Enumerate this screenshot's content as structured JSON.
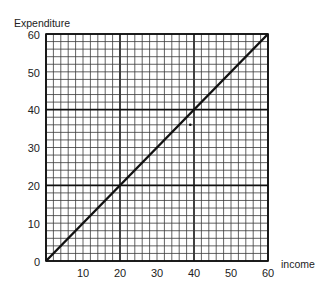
{
  "chart_data": {
    "type": "line",
    "title": "",
    "xlabel": "income",
    "ylabel": "Expenditure",
    "xlim": [
      0,
      60
    ],
    "ylim": [
      0,
      60
    ],
    "x_ticks": [
      10,
      20,
      30,
      40,
      50,
      60
    ],
    "y_ticks": [
      0,
      10,
      20,
      30,
      40,
      50,
      60
    ],
    "grid": {
      "on": true,
      "minor_step": 2,
      "major_step": 20
    },
    "series": [
      {
        "name": "45-degree line (expenditure = income)",
        "x": [
          0,
          60
        ],
        "y": [
          0,
          60
        ]
      }
    ],
    "annotations": [
      {
        "type": "dot",
        "x": 39,
        "y": 36
      }
    ],
    "legend": null
  },
  "labels": {
    "y_title": "Expenditure",
    "x_title": "income",
    "y0": "0",
    "y10": "10",
    "y20": "20",
    "y30": "30",
    "y40": "40",
    "y50": "50",
    "y60": "60",
    "x10": "10",
    "x20": "20",
    "x30": "30",
    "x40": "40",
    "x50": "50",
    "x60": "60"
  },
  "colors": {
    "ink": "#111111",
    "minor_grid": "#3a3a3a",
    "background": "#ffffff"
  }
}
